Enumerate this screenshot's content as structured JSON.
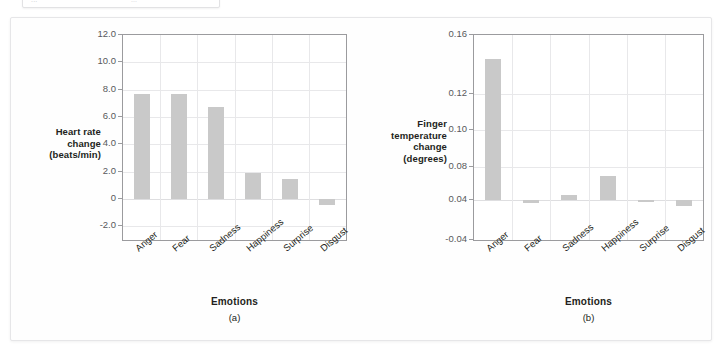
{
  "top_strip": {
    "ghost_text_left": "...",
    "ghost_text_right": "..."
  },
  "figure": {
    "panels": [
      {
        "letter": "(a)",
        "xtitle": "Emotions",
        "ylabel_lines": [
          "Heart rate",
          "change",
          "(beats/min)"
        ]
      },
      {
        "letter": "(b)",
        "xtitle": "Emotions",
        "ylabel_lines": [
          "Finger",
          "temperature",
          "change",
          "(degrees)"
        ]
      }
    ]
  },
  "chart_data": [
    {
      "type": "bar",
      "panel": "(a)",
      "title": "",
      "xlabel": "Emotions",
      "ylabel": "Heart rate change (beats/min)",
      "categories": [
        "Anger",
        "Fear",
        "Sadness",
        "Happiness",
        "Surprise",
        "Disgust"
      ],
      "values": [
        7.7,
        7.65,
        6.7,
        1.9,
        1.5,
        -0.45
      ],
      "ylim": [
        -3.0,
        12.0
      ],
      "yticks": [
        12.0,
        10.0,
        8.0,
        6.0,
        4.0,
        2.0,
        0,
        -2.0
      ],
      "ytick_labels": [
        "12.0",
        "10.0",
        "8.0",
        "6.0",
        "4.0",
        "2.0",
        "0",
        "-2.0"
      ],
      "baseline": 0,
      "grid": true,
      "legend": false,
      "bar_color": "#c9c9c9"
    },
    {
      "type": "bar",
      "panel": "(b)",
      "title": "",
      "xlabel": "Emotions",
      "ylabel": "Finger temperature change (degrees)",
      "categories": [
        "Anger",
        "Fear",
        "Sadness",
        "Happiness",
        "Surprise",
        "Disgust"
      ],
      "values": [
        0.144,
        0.034,
        0.046,
        0.069,
        0.037,
        0.029
      ],
      "ylim": [
        -0.04,
        0.16
      ],
      "yticks": [
        0.16,
        0.12,
        0.1,
        0.08,
        0.04,
        -0.04
      ],
      "ytick_labels": [
        "0.16",
        "0.12",
        "0.10",
        "0.08",
        "0.04",
        "-0.04"
      ],
      "baseline": 0.04,
      "grid": true,
      "legend": false,
      "bar_color": "#c9c9c9"
    }
  ]
}
